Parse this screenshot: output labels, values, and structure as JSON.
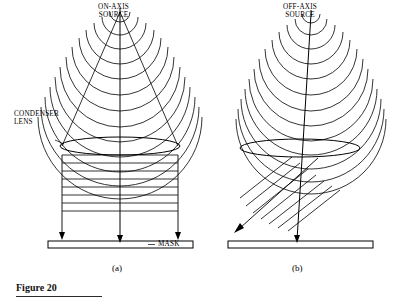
{
  "figure": {
    "caption": "Figure 20",
    "panels": [
      {
        "id": "a",
        "label": "(a)",
        "source_label": "ON-AXIS\nSOURCE"
      },
      {
        "id": "b",
        "label": "(b)",
        "source_label": "OFF-AXIS\nSOURCE"
      }
    ],
    "annotations": {
      "condenser_lens": "CONDENSER\nLENS",
      "mask": "MASK"
    },
    "colors": {
      "ink": "#000000",
      "background": "#ffffff"
    }
  }
}
